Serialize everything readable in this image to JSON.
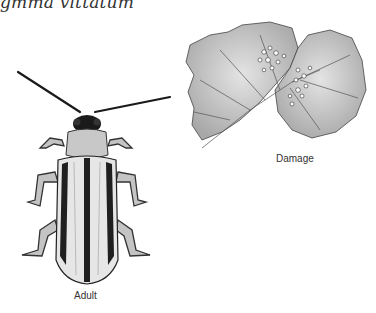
{
  "figure": {
    "title": "gmma vittatum",
    "panels": [
      {
        "label": "Adult",
        "subject": "beetle-illustration"
      },
      {
        "label": "Damage",
        "subject": "damaged-leaf-illustration"
      }
    ]
  },
  "colors": {
    "ink": "#1a1a1a",
    "mid_gray": "#9a9a9a",
    "light_gray": "#cfcfcf",
    "background": "#ffffff"
  }
}
